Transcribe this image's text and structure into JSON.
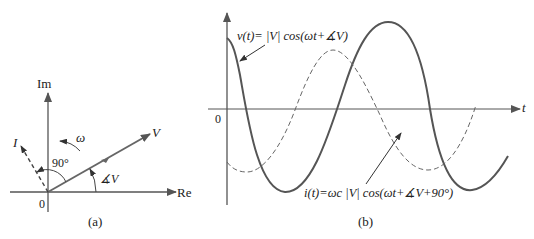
{
  "phasor": {
    "axis_im": "Im",
    "axis_re": "Re",
    "origin": "0",
    "vector_v": "V",
    "vector_i": "I",
    "omega": "ω",
    "angle_90": "90°",
    "angle_v": "∡V",
    "caption": "(a)"
  },
  "waveform": {
    "axis_t": "t",
    "origin": "0",
    "v_label": "v(t)= |V| cos(ωt+∡V)",
    "i_label": "i(t)=ωc |V| cos(ωt+∡V+90°)",
    "caption": "(b)"
  },
  "colors": {
    "solid_curve": "#555555",
    "dashed_curve": "#666666",
    "axis": "#555555"
  }
}
